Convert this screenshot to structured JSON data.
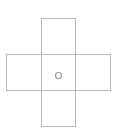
{
  "diagram": {
    "type": "cross-net",
    "panels": [
      "top",
      "left",
      "center",
      "right",
      "bottom"
    ],
    "center_marker": "circle",
    "colors": {
      "line": "#b8b8b8",
      "marker": "#999999",
      "background": "#ffffff"
    }
  }
}
